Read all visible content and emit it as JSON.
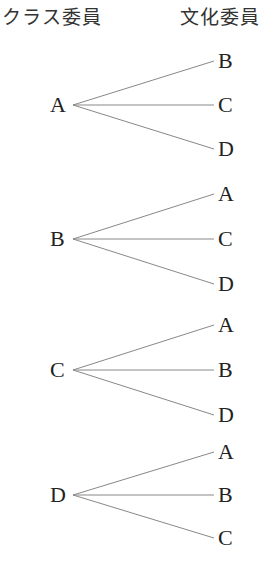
{
  "headers": {
    "left": "クラス委員",
    "right": "文化委員"
  },
  "tree": [
    {
      "root": "A",
      "y": 105,
      "branches": [
        {
          "label": "B",
          "y": 61
        },
        {
          "label": "C",
          "y": 105
        },
        {
          "label": "D",
          "y": 149
        }
      ]
    },
    {
      "root": "B",
      "y": 239,
      "branches": [
        {
          "label": "A",
          "y": 194
        },
        {
          "label": "C",
          "y": 239
        },
        {
          "label": "D",
          "y": 284
        }
      ]
    },
    {
      "root": "C",
      "y": 370,
      "branches": [
        {
          "label": "A",
          "y": 325
        },
        {
          "label": "B",
          "y": 370
        },
        {
          "label": "D",
          "y": 415
        }
      ]
    },
    {
      "root": "D",
      "y": 495,
      "branches": [
        {
          "label": "A",
          "y": 452
        },
        {
          "label": "B",
          "y": 495
        },
        {
          "label": "C",
          "y": 538
        }
      ]
    }
  ],
  "style": {
    "line_color": "#888888"
  }
}
